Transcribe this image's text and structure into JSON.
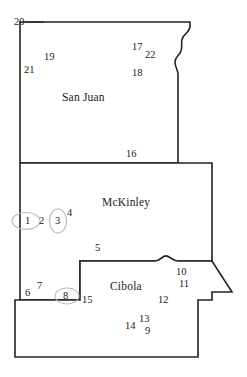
{
  "map": {
    "title": "San Juan, McKinley and Cibola county map",
    "background_color": "#ffffff",
    "line_color": "#222222",
    "highlight_color": "#b9b9b9",
    "counties": [
      {
        "id": "san-juan",
        "name": "San Juan"
      },
      {
        "id": "mckinley",
        "name": "McKinley"
      },
      {
        "id": "cibola",
        "name": "Cibola"
      }
    ],
    "site_numbers": [
      {
        "id": "site-20",
        "label": "20",
        "x": 14,
        "y": 17,
        "county": "san-juan"
      },
      {
        "id": "site-19",
        "label": "19",
        "x": 44,
        "y": 52,
        "county": "san-juan"
      },
      {
        "id": "site-21",
        "label": "21",
        "x": 24,
        "y": 65,
        "county": "san-juan"
      },
      {
        "id": "site-17",
        "label": "17",
        "x": 132,
        "y": 42,
        "county": "san-juan"
      },
      {
        "id": "site-22",
        "label": "22",
        "x": 145,
        "y": 50,
        "county": "san-juan"
      },
      {
        "id": "site-18",
        "label": "18",
        "x": 132,
        "y": 68,
        "county": "san-juan"
      },
      {
        "id": "site-16",
        "label": "16",
        "x": 126,
        "y": 149,
        "county": "san-juan"
      },
      {
        "id": "site-1",
        "label": "1",
        "x": 25,
        "y": 222,
        "county": "mckinley"
      },
      {
        "id": "site-2",
        "label": "2",
        "x": 39,
        "y": 222,
        "county": "mckinley"
      },
      {
        "id": "site-3",
        "label": "3",
        "x": 57,
        "y": 222,
        "county": "mckinley"
      },
      {
        "id": "site-4",
        "label": "4",
        "x": 69,
        "y": 214,
        "county": "mckinley"
      },
      {
        "id": "site-5",
        "label": "5",
        "x": 95,
        "y": 247,
        "county": "mckinley"
      },
      {
        "id": "site-6",
        "label": "6",
        "x": 25,
        "y": 288,
        "county": "mckinley"
      },
      {
        "id": "site-7",
        "label": "7",
        "x": 37,
        "y": 282,
        "county": "mckinley"
      },
      {
        "id": "site-8",
        "label": "8",
        "x": 65,
        "y": 293,
        "county": "mckinley"
      },
      {
        "id": "site-15",
        "label": "15",
        "x": 83,
        "y": 296,
        "county": "cibola"
      },
      {
        "id": "site-10",
        "label": "10",
        "x": 176,
        "y": 269,
        "county": "cibola"
      },
      {
        "id": "site-11",
        "label": "11",
        "x": 179,
        "y": 281,
        "county": "cibola"
      },
      {
        "id": "site-12",
        "label": "12",
        "x": 158,
        "y": 296,
        "county": "cibola"
      },
      {
        "id": "site-13",
        "label": "13",
        "x": 138,
        "y": 316,
        "county": "cibola"
      },
      {
        "id": "site-14",
        "label": "14",
        "x": 124,
        "y": 323,
        "county": "cibola"
      },
      {
        "id": "site-9",
        "label": "9",
        "x": 144,
        "y": 327,
        "county": "cibola"
      }
    ],
    "highlighted_sites": [
      "site-1",
      "site-3",
      "site-8"
    ],
    "county_labels": [
      {
        "id": "label-san-juan",
        "label": "San Juan",
        "x": 62,
        "y": 92
      },
      {
        "id": "label-mckinley",
        "label": "McKinley",
        "x": 102,
        "y": 197
      },
      {
        "id": "label-cibola",
        "label": "Cibola",
        "x": 110,
        "y": 281
      }
    ]
  }
}
